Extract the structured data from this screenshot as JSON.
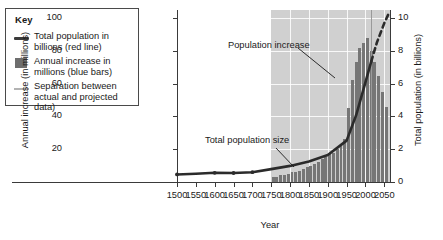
{
  "key": {
    "title": "Key",
    "items": [
      {
        "swatch": "line-dark",
        "label": "Total population in billions (red line)"
      },
      {
        "swatch": "square-dark",
        "label": "Annual increase in millions (blue bars)"
      },
      {
        "swatch": "line-light",
        "label": "Separation between actual and projected data)"
      }
    ]
  },
  "annotations": {
    "population_increase": "Population increase",
    "total_population_size": "Total population size"
  },
  "colors": {
    "bars": "#767676",
    "line": "#2b2b2b",
    "separation_line": "#9a9a9a",
    "plot_background": "#d0d0d0",
    "grid": "#ffffff",
    "axis": "#3a3a3a"
  },
  "chart_data": {
    "type": "bar",
    "title": "",
    "subtitle": "",
    "xlabel": "Year",
    "ylabel": "Annual increase (in millions)",
    "y2label": "Total population (in billions)",
    "xlim": [
      1500,
      2065
    ],
    "ylim": [
      0,
      105
    ],
    "y2lim": [
      0,
      10.5
    ],
    "xticks": [
      1500,
      1550,
      1600,
      1650,
      1700,
      1750,
      1800,
      1850,
      1900,
      1950,
      2000,
      2050
    ],
    "yticks": [
      20,
      40,
      60,
      80,
      100
    ],
    "y2ticks": [
      0,
      2,
      4,
      6,
      8,
      10
    ],
    "grid": true,
    "legend_position": "outside-left",
    "shaded_region_start": 1750,
    "separation_year": 2015,
    "series": [
      {
        "name": "Annual increase in millions (blue bars)",
        "type": "bar",
        "axis": "left",
        "x": [
          1755,
          1765,
          1775,
          1785,
          1795,
          1805,
          1815,
          1825,
          1835,
          1845,
          1855,
          1865,
          1875,
          1885,
          1895,
          1905,
          1915,
          1925,
          1935,
          1945,
          1955,
          1965,
          1975,
          1985,
          1995,
          2005,
          2015,
          2025,
          2035,
          2045,
          2055
        ],
        "values": [
          3,
          3,
          4,
          4,
          5,
          6,
          6,
          7,
          8,
          9,
          10,
          11,
          12,
          14,
          15,
          17,
          18,
          20,
          22,
          26,
          45,
          62,
          73,
          82,
          85,
          88,
          80,
          73,
          65,
          55,
          46
        ]
      },
      {
        "name": "Total population in billions (red line)",
        "type": "line",
        "axis": "right",
        "x": [
          1500,
          1550,
          1600,
          1650,
          1700,
          1750,
          1800,
          1850,
          1900,
          1950,
          1975,
          2000,
          2015,
          2030,
          2050,
          2060
        ],
        "values": [
          0.46,
          0.5,
          0.56,
          0.55,
          0.6,
          0.79,
          0.98,
          1.26,
          1.65,
          2.53,
          4.07,
          6.09,
          7.35,
          8.5,
          9.7,
          10.2
        ],
        "projected_from": 2015
      }
    ]
  }
}
